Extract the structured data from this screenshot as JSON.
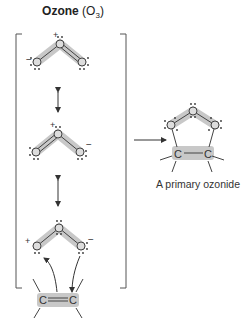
{
  "title": {
    "bold": "Ozone",
    "formula_prefix": "(O",
    "subscript": "3",
    "formula_suffix": ")"
  },
  "caption": "A primary ozonide",
  "atoms": {
    "oxygen": "O",
    "carbon": "C"
  },
  "charges": {
    "plus": "+",
    "minus": "−"
  },
  "resonance_structures": [
    {
      "id": 1,
      "left_charge": "-",
      "center_charge": "+",
      "right_charge": "",
      "double_bond": "center-right"
    },
    {
      "id": 2,
      "left_charge": "",
      "center_charge": "+",
      "right_charge": "-",
      "double_bond": "left-center"
    },
    {
      "id": 3,
      "left_charge": "+",
      "center_charge": "",
      "right_charge": "-",
      "double_bond": "none"
    }
  ],
  "colors": {
    "highlight": "#c8c8c8",
    "line": "#444444",
    "bracket": "#555555"
  }
}
